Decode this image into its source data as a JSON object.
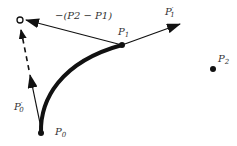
{
  "diagram": {
    "colors": {
      "stroke": "#111111",
      "label": "#333333",
      "background": "#ffffff"
    },
    "points": {
      "P0": {
        "label": "P",
        "sub": "0",
        "x": 41,
        "y": 133
      },
      "P1": {
        "label": "P",
        "sub": "1",
        "x": 122,
        "y": 45
      },
      "P2": {
        "label": "P",
        "sub": "2",
        "x": 213,
        "y": 69
      },
      "virtual": {
        "x": 20,
        "y": 20
      }
    },
    "vectors": {
      "tangent_p1": {
        "label": "P",
        "prime": "′",
        "sub": "1"
      },
      "tangent_p0": {
        "label": "P",
        "prime": "′",
        "sub": "0"
      },
      "neg_diff": {
        "label": "−(P2 − P1)"
      }
    }
  }
}
